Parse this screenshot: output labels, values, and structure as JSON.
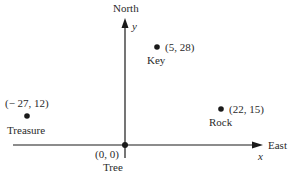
{
  "diagram": {
    "axes": {
      "x": {
        "label": "x",
        "direction_label": "East"
      },
      "y": {
        "label": "y",
        "direction_label": "North"
      }
    },
    "points": [
      {
        "name": "Tree",
        "coords": "(0, 0)",
        "x": 0,
        "y": 0
      },
      {
        "name": "Key",
        "coords": "(5, 28)",
        "x": 5,
        "y": 28
      },
      {
        "name": "Rock",
        "coords": "(22, 15)",
        "x": 22,
        "y": 15
      },
      {
        "name": "Treasure",
        "coords": "(− 27, 12)",
        "x": -27,
        "y": 12
      }
    ],
    "colors": {
      "ink": "#1a1a1a",
      "background": "#ffffff"
    }
  }
}
